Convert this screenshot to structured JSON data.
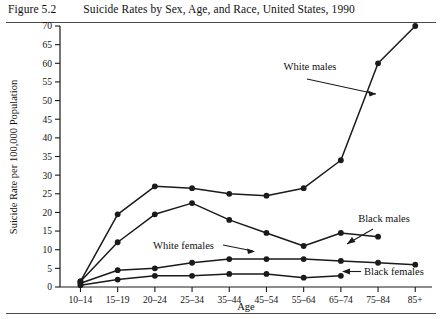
{
  "figure": {
    "number_label": "Figure 5.2",
    "title": "Suicide Rates by Sex, Age, and Race, United States, 1990"
  },
  "chart_data": {
    "type": "line",
    "title": "Suicide Rates by Sex, Age, and Race, United States, 1990",
    "xlabel": "Age",
    "ylabel": "Suicide Rate per 100,000 Population",
    "categories": [
      "10–14",
      "15–19",
      "20–24",
      "25–34",
      "35–44",
      "45–54",
      "55–64",
      "65–74",
      "75–84",
      "85+"
    ],
    "ylim": [
      0,
      70
    ],
    "yticks": [
      0,
      5,
      10,
      15,
      20,
      25,
      30,
      35,
      40,
      45,
      50,
      55,
      60,
      65,
      70
    ],
    "ytick_labels": [
      "0",
      "5",
      "10",
      "15",
      "20",
      "25",
      "30",
      "35",
      "40",
      "45",
      "50",
      "55",
      "60",
      "65",
      "70"
    ],
    "grid": false,
    "legend": "annotations-inline",
    "marker": "filled-circle",
    "line_color": "#1a1a1a",
    "series": [
      {
        "name": "White males",
        "values": [
          1.5,
          19.5,
          27,
          26.5,
          25,
          24.5,
          26.5,
          34,
          60,
          70
        ]
      },
      {
        "name": "Black males",
        "values": [
          1.5,
          12,
          19.5,
          22.5,
          18,
          14.5,
          11,
          14.5,
          13.5,
          null
        ]
      },
      {
        "name": "White females",
        "values": [
          1,
          4.5,
          5,
          6.5,
          7.5,
          7.5,
          7.5,
          7,
          6.5,
          6
        ]
      },
      {
        "name": "Black females",
        "values": [
          0.5,
          2,
          3,
          3,
          3.5,
          3.5,
          2.5,
          3,
          null,
          null
        ]
      }
    ],
    "annotations": [
      {
        "text": "White males",
        "anchor_category": "75–84"
      },
      {
        "text": "Black males",
        "anchor_category": "65–74"
      },
      {
        "text": "White females",
        "anchor_category": "45–54"
      },
      {
        "text": "Black females",
        "anchor_category": "65–74"
      }
    ]
  }
}
